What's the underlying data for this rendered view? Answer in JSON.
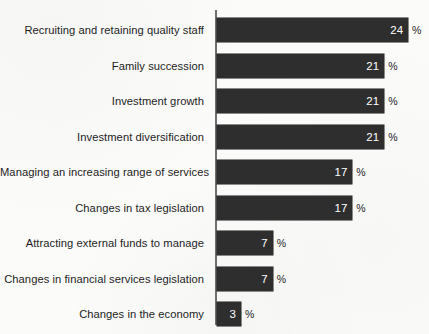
{
  "chart_data": {
    "type": "bar",
    "orientation": "horizontal",
    "title": "",
    "subtitle": "",
    "xlabel": "",
    "ylabel": "",
    "value_suffix": "%",
    "xlim": [
      0,
      24
    ],
    "grid": false,
    "legend": null,
    "bar_color": "#2e2e2e",
    "axis_color": "#6f6f6f",
    "background_color": "#fbfbfa",
    "label_color": "#1d1d1d",
    "value_text_color": "#ffffff",
    "categories": [
      "Recruiting and retaining quality staff",
      "Family succession",
      "Investment growth",
      "Investment diversification",
      "Managing an increasing range of services",
      "Changes in tax legislation",
      "Attracting external funds to manage",
      "Changes in financial services legislation",
      "Changes in the economy"
    ],
    "values": [
      24,
      21,
      21,
      21,
      17,
      17,
      7,
      7,
      3
    ],
    "value_labels": [
      "24",
      "21",
      "21",
      "21",
      "17",
      "17",
      "7",
      "7",
      "3"
    ],
    "percent_signs": [
      "%",
      "%",
      "%",
      "%",
      "%",
      "%",
      "%",
      "%",
      "%"
    ]
  },
  "axis": {
    "name": "category-axis"
  }
}
